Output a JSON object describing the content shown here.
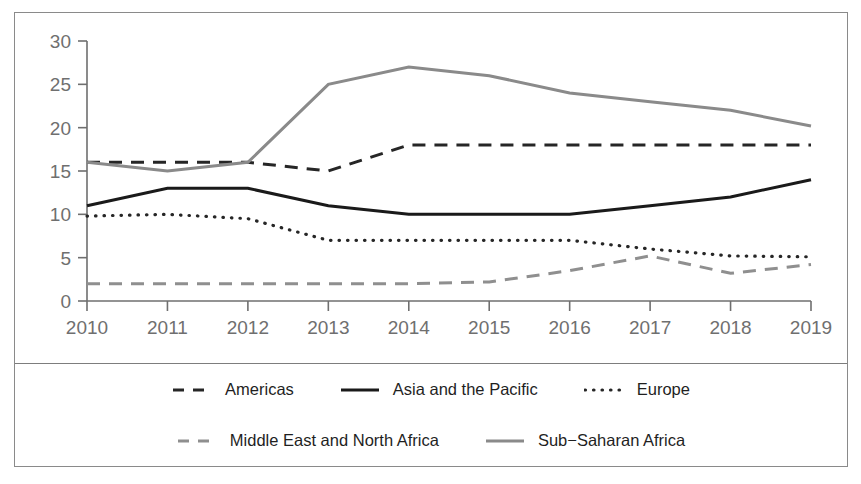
{
  "chart_data": {
    "type": "line",
    "title": "",
    "subtitle": "",
    "xlabel": "",
    "ylabel": "",
    "categories": [
      "2010",
      "2011",
      "2012",
      "2013",
      "2014",
      "2015",
      "2016",
      "2017",
      "2018",
      "2019"
    ],
    "x": [
      2010,
      2011,
      2012,
      2013,
      2014,
      2015,
      2016,
      2017,
      2018,
      2019
    ],
    "xlim": [
      2010,
      2019
    ],
    "ylim": [
      0,
      30
    ],
    "yticks": [
      0,
      5,
      10,
      15,
      20,
      25,
      30
    ],
    "xticks": [
      "2010",
      "2011",
      "2012",
      "2013",
      "2014",
      "2015",
      "2016",
      "2017",
      "2018",
      "2019"
    ],
    "grid": false,
    "legend_position": "bottom",
    "series": [
      {
        "name": "Americas",
        "values": [
          16,
          16,
          16,
          15,
          18,
          18,
          18,
          18,
          18,
          18
        ],
        "color": "#262626",
        "style": "dashed"
      },
      {
        "name": "Asia and the Pacific",
        "values": [
          11,
          13,
          13,
          11,
          10,
          10,
          10,
          11,
          12,
          14
        ],
        "color": "#1a1a1a",
        "style": "solid"
      },
      {
        "name": "Europe",
        "values": [
          9.8,
          10,
          9.5,
          7,
          7,
          7,
          7,
          6,
          5.2,
          5.1
        ],
        "color": "#262626",
        "style": "dotted"
      },
      {
        "name": "Middle East and North Africa",
        "values": [
          2,
          2,
          2,
          2,
          2,
          2.2,
          3.5,
          5.2,
          3.2,
          4.2
        ],
        "color": "#8f8f8f",
        "style": "dashed"
      },
      {
        "name": "Sub−Saharan Africa",
        "values": [
          16,
          15,
          16,
          25,
          27,
          26,
          24,
          23,
          22,
          20.2
        ],
        "color": "#8a8a8a",
        "style": "solid"
      }
    ]
  },
  "legend": {
    "row1": [
      "Americas",
      "Asia and the Pacific",
      "Europe"
    ],
    "row2": [
      "Middle East and North Africa",
      "Sub−Saharan Africa"
    ]
  },
  "colors": {
    "frame": "#8a8a8a",
    "axis": "#6f6f6f",
    "tick_text": "#6f6f6f",
    "series_dark": "#1f1f1f",
    "series_gray": "#8a8a8a",
    "background": "#ffffff"
  }
}
